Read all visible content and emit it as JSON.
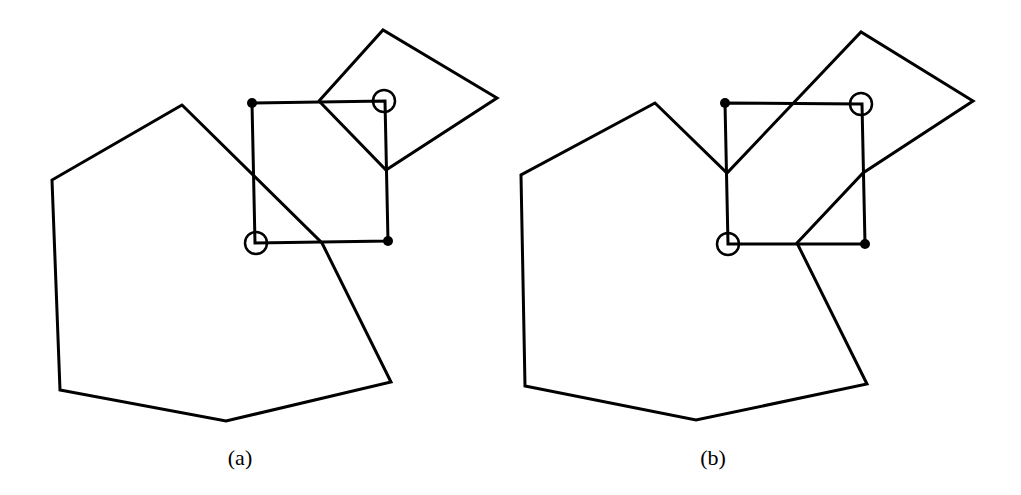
{
  "figure": {
    "panels": [
      {
        "id": "a",
        "caption": "(a)",
        "caption_pos": [
          240,
          465
        ],
        "large_polygon": [
          [
            182,
            105
          ],
          [
            52,
            180
          ],
          [
            60,
            390
          ],
          [
            226,
            421
          ],
          [
            391,
            382
          ],
          [
            322,
            243
          ],
          [
            182,
            105
          ]
        ],
        "square": [
          [
            252,
            103
          ],
          [
            385,
            101
          ],
          [
            388,
            241
          ],
          [
            255,
            243
          ]
        ],
        "small_polygon": [
          [
            319,
            101
          ],
          [
            383,
            30
          ],
          [
            497,
            98
          ],
          [
            386,
            170
          ],
          [
            319,
            101
          ]
        ],
        "filled_vertices": [
          [
            252,
            103
          ],
          [
            388,
            241
          ]
        ],
        "circled_vertices": [
          [
            384,
            101
          ],
          [
            256,
            243
          ]
        ]
      },
      {
        "id": "b",
        "caption": "(b)",
        "caption_pos": [
          713,
          465
        ],
        "merged_polygon": [
          [
            655,
            103
          ],
          [
            521,
            175
          ],
          [
            525,
            386
          ],
          [
            696,
            420
          ],
          [
            867,
            384
          ],
          [
            797,
            243
          ],
          [
            863,
            173
          ],
          [
            973,
            101
          ],
          [
            861,
            32
          ],
          [
            727,
            173
          ],
          [
            655,
            103
          ]
        ],
        "square": [
          [
            725,
            103
          ],
          [
            862,
            104
          ],
          [
            865,
            244
          ],
          [
            728,
            244
          ]
        ],
        "filled_vertices": [
          [
            725,
            103
          ],
          [
            865,
            244
          ]
        ],
        "circled_vertices": [
          [
            861,
            104
          ],
          [
            728,
            244
          ]
        ]
      }
    ],
    "colors": {
      "stroke": "#000000",
      "background": "#ffffff"
    }
  }
}
